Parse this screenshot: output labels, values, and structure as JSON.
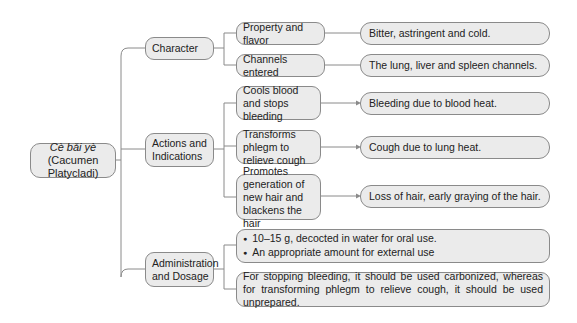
{
  "root": {
    "title_italic": "Cè bǎi yè",
    "title_latin": "(Cacumen Platycladi)"
  },
  "branches": [
    {
      "label": "Character",
      "children": [
        {
          "label": "Property and flavor",
          "detail": "Bitter, astringent and cold."
        },
        {
          "label": "Channels entered",
          "detail": "The lung, liver and spleen channels."
        }
      ]
    },
    {
      "label": "Actions and Indications",
      "children": [
        {
          "label": "Cools blood and stops bleeding",
          "detail": "Bleeding due to blood heat."
        },
        {
          "label": "Transforms phlegm to relieve cough",
          "detail": "Cough due to lung heat."
        },
        {
          "label": "Promotes  generation of new hair and blackens the hair",
          "detail": "Loss of hair, early graying of the hair."
        }
      ]
    },
    {
      "label": "Administration and Dosage",
      "children": [
        {
          "bullets": [
            "10–15 g, decocted in water for oral use.",
            "An appropriate amount for external use"
          ]
        },
        {
          "text": "For stopping bleeding, it should be used carbonized, whereas for transforming phlegm to relieve cough, it should be used unprepared."
        }
      ]
    }
  ],
  "colors": {
    "node_fill": "#ebebeb",
    "node_border": "#8a8a8a",
    "line": "#8a8a8a"
  }
}
